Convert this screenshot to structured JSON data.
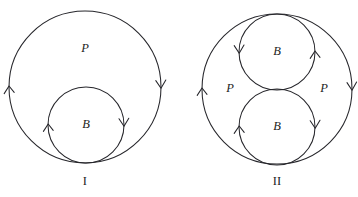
{
  "figure": {
    "background_color": "#ffffff",
    "stroke_color": "#26262b",
    "text_color": "#1d1d22",
    "panels": [
      {
        "caption": "I",
        "caption_x": 85,
        "caption_y": 182,
        "outer_circle": {
          "label": "P",
          "label_x": 85,
          "label_y": 49,
          "cx": 85,
          "cy": 87,
          "r": 76,
          "arrows": [
            {
              "name": "outer-left-arrow-up",
              "angle_deg": 180,
              "direction": "up"
            },
            {
              "name": "outer-right-arrow-down",
              "angle_deg": 0,
              "direction": "down"
            }
          ]
        },
        "inner_circles": [
          {
            "label": "B",
            "label_x": 86,
            "label_y": 125,
            "cx": 86,
            "cy": 125,
            "r": 38,
            "arrows": [
              {
                "name": "inner-left-arrow-up",
                "angle_deg": 180,
                "direction": "up"
              },
              {
                "name": "inner-right-arrow-down",
                "angle_deg": 0,
                "direction": "down"
              }
            ]
          }
        ],
        "extra_labels": []
      },
      {
        "caption": "II",
        "caption_x": 277,
        "caption_y": 182,
        "outer_circle": {
          "label": "",
          "cx": 277,
          "cy": 89,
          "r": 75,
          "arrows": [
            {
              "name": "outer-left-arrow-up",
              "angle_deg": 180,
              "direction": "up"
            },
            {
              "name": "outer-right-arrow-down",
              "angle_deg": 0,
              "direction": "down"
            }
          ]
        },
        "inner_circles": [
          {
            "label": "B",
            "label_x": 277,
            "label_y": 52,
            "cx": 277,
            "cy": 52,
            "r": 38,
            "arrows": [
              {
                "name": "top-b-left-arrow-down",
                "angle_deg": 180,
                "direction": "down"
              },
              {
                "name": "top-b-right-arrow-up",
                "angle_deg": 0,
                "direction": "up"
              }
            ]
          },
          {
            "label": "B",
            "label_x": 277,
            "label_y": 127,
            "cx": 277,
            "cy": 127,
            "r": 38,
            "arrows": [
              {
                "name": "bottom-b-left-arrow-up",
                "angle_deg": 180,
                "direction": "up"
              },
              {
                "name": "bottom-b-right-arrow-down",
                "angle_deg": 0,
                "direction": "down"
              }
            ]
          }
        ],
        "extra_labels": [
          {
            "name": "region-label-p-left",
            "text": "P",
            "x": 230,
            "y": 89
          },
          {
            "name": "region-label-p-right",
            "text": "P",
            "x": 324,
            "y": 89
          }
        ]
      }
    ]
  },
  "labels": {
    "panel1_caption": "I",
    "panel1_outer": "P",
    "panel1_inner": "B",
    "panel2_caption": "II",
    "panel2_top_inner": "B",
    "panel2_bottom_inner": "B",
    "panel2_p_left": "P",
    "panel2_p_right": "P"
  }
}
